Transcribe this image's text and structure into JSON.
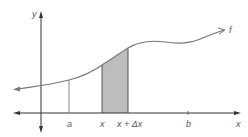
{
  "diagram": {
    "type": "area-under-curve",
    "labels": {
      "y_axis": "y",
      "x_axis": "x",
      "function": "f",
      "a": "a",
      "x": "x",
      "x_plus_dx": "x + Δx",
      "b": "b"
    },
    "colors": {
      "axis": "#333333",
      "curve": "#777777",
      "shade": "#bdbdbd",
      "guide": "#666666",
      "text": "#555555"
    },
    "shaded_interval": [
      "x",
      "x + Δx"
    ]
  }
}
